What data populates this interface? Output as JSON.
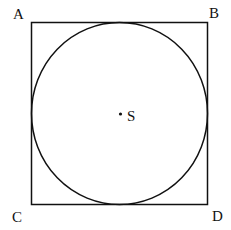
{
  "diagram": {
    "vertices": {
      "top_left": "A",
      "top_right": "B",
      "bottom_left": "C",
      "bottom_right": "D"
    },
    "center_label": "S",
    "colors": {
      "stroke": "#111111",
      "background": "#ffffff"
    }
  }
}
